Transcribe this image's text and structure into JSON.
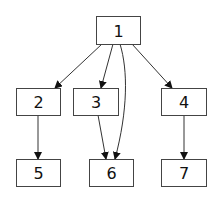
{
  "diagram": {
    "type": "tree",
    "colors": {
      "background": "#ffffff",
      "node_fill": "#ffffff",
      "node_stroke": "#444444",
      "edge": "#333333",
      "text": "#111111"
    },
    "nodes": [
      {
        "id": "1",
        "label": "1",
        "x": 96,
        "y": 16,
        "w": 44,
        "h": 28
      },
      {
        "id": "2",
        "label": "2",
        "x": 16,
        "y": 88,
        "w": 44,
        "h": 27
      },
      {
        "id": "3",
        "label": "3",
        "x": 73,
        "y": 88,
        "w": 45,
        "h": 27
      },
      {
        "id": "4",
        "label": "4",
        "x": 161,
        "y": 88,
        "w": 45,
        "h": 27
      },
      {
        "id": "5",
        "label": "5",
        "x": 16,
        "y": 159,
        "w": 44,
        "h": 27
      },
      {
        "id": "6",
        "label": "6",
        "x": 89,
        "y": 159,
        "w": 44,
        "h": 27
      },
      {
        "id": "7",
        "label": "7",
        "x": 161,
        "y": 159,
        "w": 45,
        "h": 27
      }
    ],
    "edges": [
      {
        "from": "1",
        "to": "2",
        "path": "M102,44 L55,88"
      },
      {
        "from": "1",
        "to": "3",
        "path": "M113,44 L101,88"
      },
      {
        "from": "1",
        "to": "6",
        "path": "M120,44 C128,70 128,110 115,159"
      },
      {
        "from": "1",
        "to": "4",
        "path": "M132,44 L172,88"
      },
      {
        "from": "2",
        "to": "5",
        "path": "M38,115 L38,159"
      },
      {
        "from": "3",
        "to": "6",
        "path": "M98,115 L106,159"
      },
      {
        "from": "4",
        "to": "7",
        "path": "M184,115 L184,159"
      }
    ]
  }
}
